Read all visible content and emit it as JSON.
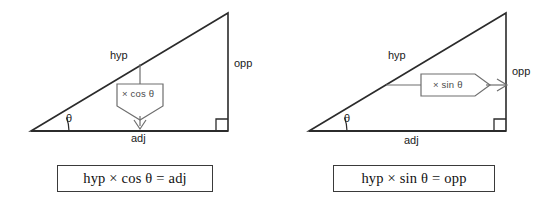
{
  "page": {
    "background_color": "#ffffff",
    "line_color": "#2b2b2b",
    "callout_color": "#6e6e6e",
    "width": 556,
    "height": 200
  },
  "panels": [
    {
      "id": "cosine-panel",
      "triangle": {
        "side_labels": {
          "hypotenuse": "hyp",
          "opposite": "opp",
          "adjacent": "adj"
        },
        "angle_label": "θ",
        "right_angle_marker": "right-angle"
      },
      "callout": {
        "label": "× cos θ",
        "direction": "down",
        "from": "hyp",
        "to": "adj"
      },
      "formula": "hyp × cos θ = adj"
    },
    {
      "id": "sine-panel",
      "triangle": {
        "side_labels": {
          "hypotenuse": "hyp",
          "opposite": "opp",
          "adjacent": "adj"
        },
        "angle_label": "θ",
        "right_angle_marker": "right-angle"
      },
      "callout": {
        "label": "× sin θ",
        "direction": "right",
        "from": "hyp",
        "to": "opp"
      },
      "formula": "hyp × sin θ = opp"
    }
  ]
}
